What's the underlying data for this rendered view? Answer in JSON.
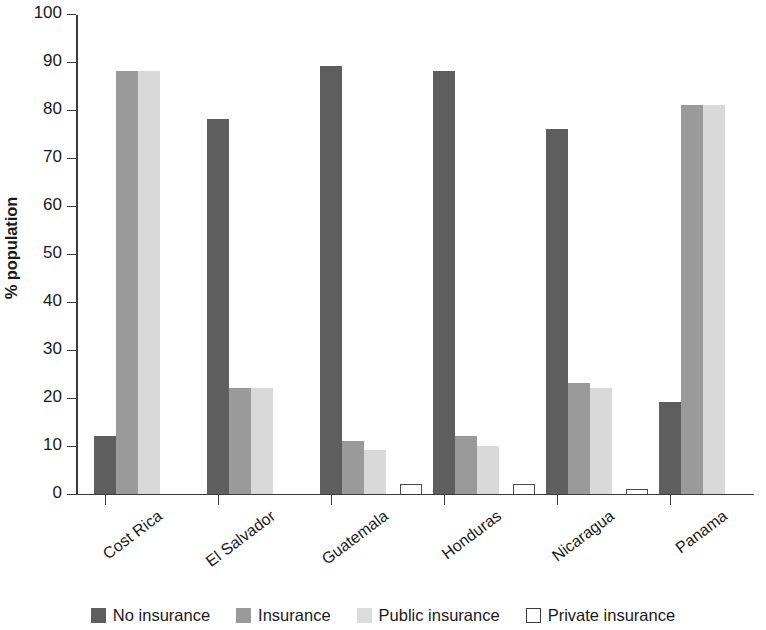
{
  "chart_data": {
    "type": "bar",
    "title": "",
    "xlabel": "",
    "ylabel": "% population",
    "ylim": [
      0,
      100
    ],
    "ytick_interval": 10,
    "yticks": [
      0,
      10,
      20,
      30,
      40,
      50,
      60,
      70,
      80,
      90,
      100
    ],
    "grid": false,
    "legend_position": "bottom",
    "categories": [
      "Cost Rica",
      "El Salvador",
      "Guatemala",
      "Honduras",
      "Nicaragua",
      "Panama"
    ],
    "series": [
      {
        "name": "No insurance",
        "color": "#5e5e5e",
        "values": [
          12,
          78,
          89,
          88,
          76,
          19
        ]
      },
      {
        "name": "Insurance",
        "color": "#9a9a9a",
        "values": [
          88,
          22,
          11,
          12,
          23,
          81
        ]
      },
      {
        "name": "Public insurance",
        "color": "#d9d9d9",
        "values": [
          88,
          22,
          9,
          10,
          22,
          81
        ]
      },
      {
        "name": "Private insurance",
        "color": "#ffffff",
        "values": [
          null,
          null,
          2,
          2,
          1,
          null
        ]
      }
    ]
  },
  "axis": {
    "y_title": "% population",
    "y_tick_labels": [
      "100",
      "90",
      "80",
      "70",
      "60",
      "50",
      "40",
      "30",
      "20",
      "10",
      "0"
    ],
    "x_tick_labels": [
      "Cost Rica",
      "El Salvador",
      "Guatemala",
      "Honduras",
      "Nicaragua",
      "Panama"
    ]
  },
  "legend": {
    "items": [
      {
        "label": "No insurance",
        "swatch": "dark-gray-swatch"
      },
      {
        "label": "Insurance",
        "swatch": "medium-gray-swatch"
      },
      {
        "label": "Public insurance",
        "swatch": "light-gray-swatch"
      },
      {
        "label": "Private insurance",
        "swatch": "white-outline-swatch"
      }
    ]
  },
  "colors": {
    "no_insurance": "#5e5e5e",
    "insurance": "#9a9a9a",
    "public_insurance": "#d9d9d9",
    "private_insurance": "#ffffff",
    "axis": "#3b3b3b",
    "background": "#ffffff"
  }
}
